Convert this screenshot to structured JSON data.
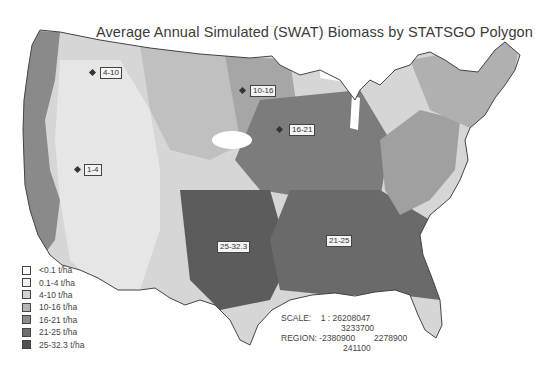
{
  "title": "Average Annual Simulated (SWAT) Biomass by STATSGO Polygon",
  "map_labels": [
    {
      "text": "4-10",
      "x": 102,
      "y": 67,
      "dot_x": 92,
      "dot_y": 72
    },
    {
      "text": "10-16",
      "x": 252,
      "y": 87,
      "dot_x": 242,
      "dot_y": 90
    },
    {
      "text": "16-21",
      "x": 290,
      "y": 126,
      "dot_x": 279,
      "dot_y": 129
    },
    {
      "text": "1-4",
      "x": 84,
      "y": 165,
      "dot_x": 75,
      "dot_y": 168
    },
    {
      "text": "25-32.3",
      "x": 217,
      "y": 241
    },
    {
      "text": "21-25",
      "x": 327,
      "y": 236
    }
  ],
  "legend": {
    "items": [
      {
        "label": "<0.1 t/ha",
        "color": "#ffffff"
      },
      {
        "label": "0.1-4 t/ha",
        "color": "#f0f0f0"
      },
      {
        "label": "4-10 t/ha",
        "color": "#d2d2d2"
      },
      {
        "label": "10-16 t/ha",
        "color": "#b4b4b4"
      },
      {
        "label": "16-21 t/ha",
        "color": "#8c8c8c"
      },
      {
        "label": "21-25 t/ha",
        "color": "#6e6e6e"
      },
      {
        "label": "25-32.3 t/ha",
        "color": "#505050"
      }
    ]
  },
  "scale_info": {
    "scale_label": "SCALE:",
    "scale_value": "1 : 26208047",
    "top_value": "3233700",
    "region_label": "REGION:",
    "region_left": "-2380900",
    "region_right": "2278900",
    "bottom_value": "241100"
  }
}
